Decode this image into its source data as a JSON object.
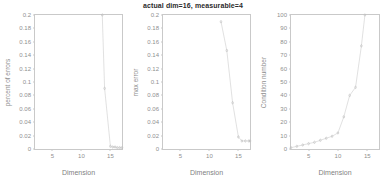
{
  "figure": {
    "background": "#ffffff",
    "axis_color": "#c9c9c9",
    "tick_text_color": "#8f8f8f",
    "line_color": "#d4d4d4",
    "marker_color": "#bdbdbd",
    "title_color": "#2b2b2b"
  },
  "title": "actual dim=16,  measurable=4",
  "chart_data": [
    {
      "type": "line",
      "title": "",
      "xlabel": "Dimension",
      "ylabel": "percent of errors",
      "xlim": [
        2,
        17
      ],
      "ylim": [
        0,
        0.2
      ],
      "xticks": [
        5,
        10,
        15
      ],
      "xticklabels": [
        "5",
        "10",
        "15"
      ],
      "yticks": [
        0,
        0.02,
        0.04,
        0.06,
        0.08,
        0.1,
        0.12,
        0.14,
        0.16,
        0.18,
        0.2
      ],
      "yticklabels": [
        "0",
        "0.02",
        "0.04",
        "0.06",
        "0.08",
        "0.1",
        "0.12",
        "0.14",
        "0.16",
        "0.18",
        "0.2"
      ],
      "grid": false,
      "legend": "none",
      "marker": "dot",
      "x": [
        13.6,
        14.0,
        15.0,
        15.4,
        15.8,
        16.2,
        16.6,
        17.0
      ],
      "y": [
        0.2,
        0.0905,
        0.004,
        0.003,
        0.003,
        0.002,
        0.002,
        0.002
      ]
    },
    {
      "type": "line",
      "title": "actual dim=16,  measurable=4",
      "xlabel": "Dimension",
      "ylabel": "max error",
      "xlim": [
        2,
        17
      ],
      "ylim": [
        0,
        0.2
      ],
      "xticks": [
        5,
        10,
        15
      ],
      "xticklabels": [
        "5",
        "10",
        "15"
      ],
      "yticks": [
        0,
        0.02,
        0.04,
        0.06,
        0.08,
        0.1,
        0.12,
        0.14,
        0.16,
        0.18,
        0.2
      ],
      "yticklabels": [
        "0",
        "0.02",
        "0.04",
        "0.06",
        "0.08",
        "0.1",
        "0.12",
        "0.14",
        "0.16",
        "0.18",
        "0.2"
      ],
      "grid": false,
      "legend": "none",
      "marker": "dot",
      "x": [
        12.0,
        13.0,
        14.0,
        15.0,
        15.6,
        16.2,
        16.8,
        17.0
      ],
      "y": [
        0.19,
        0.147,
        0.069,
        0.018,
        0.012,
        0.012,
        0.012,
        0.012
      ]
    },
    {
      "type": "line",
      "title": "",
      "xlabel": "Dimension",
      "ylabel": "Condition number",
      "xlim": [
        2,
        17
      ],
      "ylim": [
        0,
        100
      ],
      "xticks": [
        5,
        10,
        15
      ],
      "xticklabels": [
        "5",
        "10",
        "15"
      ],
      "yticks": [
        0,
        10,
        20,
        30,
        40,
        50,
        60,
        70,
        80,
        90,
        100
      ],
      "yticklabels": [
        "0",
        "10",
        "20",
        "30",
        "40",
        "50",
        "60",
        "70",
        "80",
        "90",
        "100"
      ],
      "grid": false,
      "legend": "none",
      "marker": "dot",
      "x": [
        2,
        3,
        4,
        5,
        6,
        7,
        8,
        9,
        10,
        11,
        12,
        13,
        14,
        14.6
      ],
      "y": [
        1,
        2,
        3,
        4,
        5,
        6.5,
        8,
        9.5,
        12,
        24,
        40,
        46,
        77,
        100
      ]
    }
  ]
}
